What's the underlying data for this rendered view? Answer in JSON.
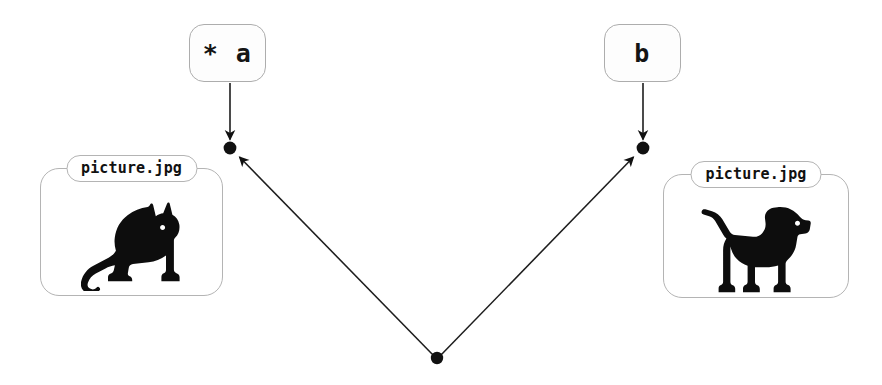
{
  "diagram": {
    "background_color": "#ffffff",
    "stroke_color": "#1a1a1a",
    "border_color": "#b4b4b4",
    "variables": [
      {
        "id": "a",
        "label": "* a",
        "icon": "dereferenced-pointer-label"
      },
      {
        "id": "b",
        "label": "b",
        "icon": "variable-label"
      }
    ],
    "objects": [
      {
        "id": "cat",
        "filename": "picture.jpg",
        "icon": "cat-silhouette",
        "description": "sitting cat silhouette facing right"
      },
      {
        "id": "dog",
        "filename": "picture.jpg",
        "icon": "dog-silhouette",
        "description": "standing dog silhouette facing right"
      }
    ],
    "nodes": [
      {
        "id": "node-a",
        "x": 230,
        "y": 148,
        "label": "reference-node-a"
      },
      {
        "id": "node-b",
        "x": 643,
        "y": 148,
        "label": "reference-node-b"
      },
      {
        "id": "node-origin",
        "x": 437,
        "y": 358,
        "label": "shared-origin-node"
      }
    ],
    "edges": [
      {
        "id": "edge-a-down",
        "from": "var-a",
        "to": "node-a",
        "arrow": "down"
      },
      {
        "id": "edge-b-down",
        "from": "var-b",
        "to": "node-b",
        "arrow": "down"
      },
      {
        "id": "edge-origin-a",
        "from": "node-origin",
        "to": "node-a",
        "arrow": "up-left"
      },
      {
        "id": "edge-origin-b",
        "from": "node-origin",
        "to": "node-b",
        "arrow": "up-right"
      }
    ]
  }
}
